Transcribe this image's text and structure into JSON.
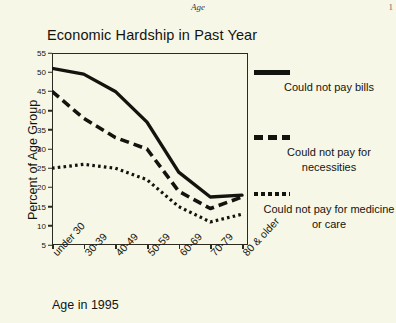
{
  "page": {
    "running_head": "Age",
    "page_number": "1"
  },
  "chart_data": {
    "type": "line",
    "title": "Economic Hardship in Past Year",
    "xlabel": "Age in 1995",
    "ylabel": "Percent of Age Group",
    "categories": [
      "under 30",
      "30-39",
      "40-49",
      "50-59",
      "60-69",
      "70-79",
      "80 & older"
    ],
    "ylim": [
      5,
      55
    ],
    "yticks": [
      55,
      50,
      45,
      40,
      35,
      30,
      25,
      20,
      15,
      10,
      5
    ],
    "grid": false,
    "legend_position": "right",
    "series": [
      {
        "name": "Could not pay bills",
        "style": "solid",
        "values": [
          51,
          49.5,
          45,
          37,
          24,
          17.5,
          18
        ]
      },
      {
        "name": "Could not pay for necessities",
        "style": "dashed",
        "values": [
          45,
          38,
          33,
          30,
          19,
          14.5,
          17.5
        ]
      },
      {
        "name": "Could not pay for medicine or care",
        "style": "dotted",
        "values": [
          25,
          26,
          25,
          22,
          15,
          11,
          13
        ]
      }
    ]
  }
}
